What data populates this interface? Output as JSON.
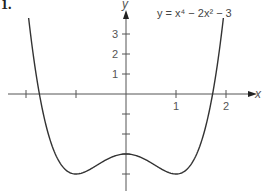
{
  "problem_number": "1.",
  "chart_data": {
    "type": "line",
    "title": "",
    "equation_label": "y = x⁴ − 2x² − 3",
    "xlabel": "x",
    "ylabel": "y",
    "xlim": [
      -2.1,
      2.1
    ],
    "ylim": [
      -4.4,
      4.2
    ],
    "x_ticks": [
      -2,
      -1,
      1,
      2
    ],
    "x_tick_labels": [
      "",
      "",
      "1",
      "2"
    ],
    "y_ticks": [
      -4,
      -3,
      -2,
      -1,
      1,
      2,
      3
    ],
    "y_tick_labels": [
      "",
      "",
      "",
      "",
      "1",
      "2",
      "3"
    ],
    "grid": false,
    "series": [
      {
        "name": "y = x^4 - 2x^2 - 3",
        "x": [
          -2.05,
          -1.9,
          -1.8,
          -1.732,
          -1.6,
          -1.4,
          -1.2,
          -1.0,
          -0.8,
          -0.6,
          -0.4,
          -0.2,
          0,
          0.2,
          0.4,
          0.6,
          0.8,
          1.0,
          1.2,
          1.4,
          1.6,
          1.732,
          1.8,
          1.9,
          2.05
        ],
        "y": [
          5.26,
          2.81,
          1.02,
          0.0,
          -1.57,
          -3.08,
          -3.81,
          -4.0,
          -3.87,
          -3.59,
          -3.29,
          -3.08,
          -3.0,
          -3.08,
          -3.29,
          -3.59,
          -3.87,
          -4.0,
          -3.81,
          -3.08,
          -1.57,
          0.0,
          1.02,
          2.81,
          5.26
        ],
        "color": "#333333"
      }
    ],
    "key_points": {
      "x_intercepts": [
        -1.732,
        1.732
      ],
      "y_intercept": -3,
      "local_max": [
        0,
        -3
      ],
      "local_min": [
        [
          -1,
          -4
        ],
        [
          1,
          -4
        ]
      ]
    }
  }
}
